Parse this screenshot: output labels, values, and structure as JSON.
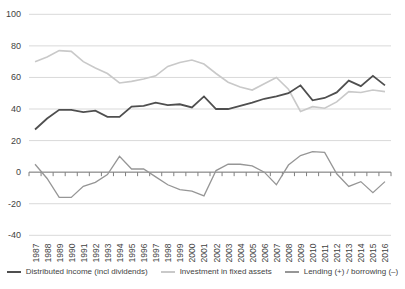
{
  "chart_data": {
    "type": "line",
    "title": "",
    "x": [
      1987,
      1988,
      1989,
      1990,
      1991,
      1992,
      1993,
      1994,
      1995,
      1996,
      1997,
      1998,
      1999,
      2000,
      2001,
      2002,
      2003,
      2004,
      2005,
      2006,
      2007,
      2008,
      2009,
      2010,
      2011,
      2012,
      2013,
      2014,
      2015,
      2016
    ],
    "series": [
      {
        "name": "Distributed income (incl dividends)",
        "slug": "distributed-income-line",
        "color": "#4f4f4f",
        "width": 1.8,
        "values": [
          27,
          34,
          39.5,
          39.5,
          38,
          39,
          35,
          35,
          41.5,
          42,
          44,
          42.5,
          43,
          41,
          48,
          40,
          40,
          42,
          44,
          46.5,
          48,
          50,
          55,
          45.5,
          47,
          50.5,
          58,
          54.5,
          61,
          55
        ]
      },
      {
        "name": "Investment in fixed assets",
        "slug": "investment-fixed-assets-line",
        "color": "#c9c9c9",
        "width": 1.6,
        "values": [
          70,
          73,
          77,
          76.5,
          70,
          66,
          62.5,
          56.5,
          57.5,
          59,
          61,
          67,
          69.5,
          71,
          68.5,
          62.5,
          57,
          54,
          52,
          56,
          60,
          52.5,
          38.5,
          41.5,
          40.5,
          44.5,
          51,
          50.5,
          52,
          51
        ]
      },
      {
        "name": "Lending (+) / borrowing (–)",
        "slug": "lending-borrowing-line",
        "color": "#969696",
        "width": 1.3,
        "values": [
          5,
          -4,
          -16,
          -16,
          -9,
          -6.5,
          -1.5,
          10,
          2,
          2,
          -3,
          -8,
          -11,
          -12,
          -15,
          1,
          5,
          5,
          4,
          0,
          -8,
          4.5,
          10.5,
          13,
          12.5,
          -1,
          -9,
          -6,
          -13,
          -6
        ]
      }
    ],
    "ylim": [
      -40,
      100
    ],
    "yticks": [
      100,
      80,
      60,
      40,
      20,
      0,
      -20,
      -40
    ],
    "ytick_labels": [
      "100",
      "80",
      "60",
      "40",
      "20",
      "0",
      "-20",
      "-40"
    ],
    "grid": true,
    "legend_position": "bottom"
  },
  "colors": {
    "grid": "#d9d9d9",
    "axis": "#7f7f7f",
    "text": "#3f3f3f",
    "background": "#ffffff"
  }
}
